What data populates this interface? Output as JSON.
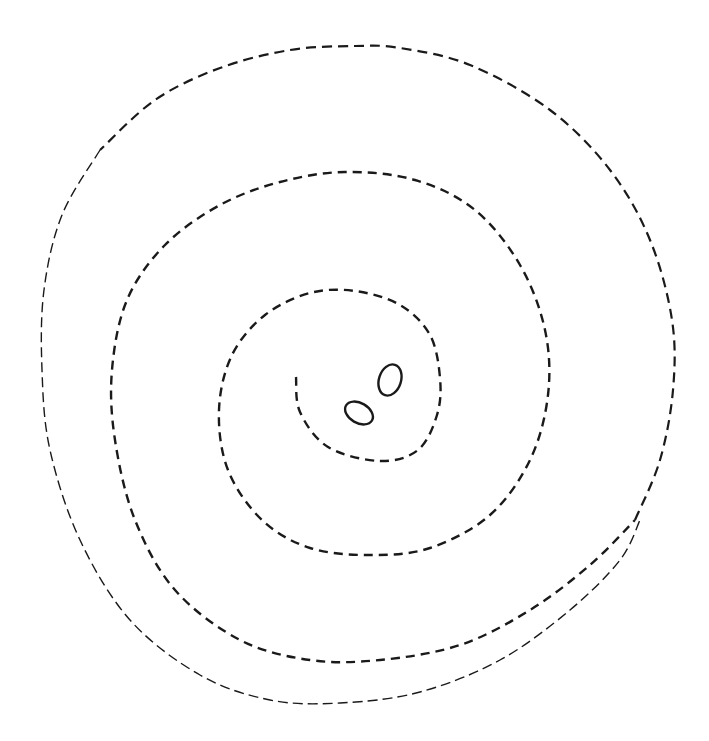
{
  "figure": {
    "background_color": "#ffffff",
    "stroke_color": "#1a1a1a",
    "elements": {
      "spiral": {
        "type": "dashed-spiral",
        "start_point": [
          296,
          377
        ],
        "turns": 3.5,
        "inner_segment": {
          "stroke_width": 2.4,
          "dash": "9 6",
          "points": [
            [
              296,
              377
            ],
            [
              300,
              412
            ],
            [
              328,
              447
            ],
            [
              380,
              461
            ],
            [
              418,
              450
            ],
            [
              437,
              415
            ],
            [
              440,
              378
            ],
            [
              430,
              335
            ],
            [
              400,
              305
            ],
            [
              355,
              291
            ],
            [
              310,
              293
            ],
            [
              265,
              315
            ],
            [
              232,
              355
            ],
            [
              219,
              410
            ],
            [
              228,
              470
            ],
            [
              262,
              520
            ],
            [
              310,
              548
            ],
            [
              370,
              555
            ],
            [
              430,
              548
            ],
            [
              490,
              515
            ],
            [
              530,
              460
            ],
            [
              548,
              395
            ],
            [
              545,
              330
            ],
            [
              520,
              265
            ],
            [
              475,
              210
            ],
            [
              415,
              180
            ],
            [
              345,
              172
            ],
            [
              280,
              182
            ],
            [
              220,
              205
            ],
            [
              165,
              245
            ],
            [
              127,
              300
            ],
            [
              112,
              370
            ],
            [
              115,
              440
            ],
            [
              135,
              520
            ],
            [
              175,
              590
            ],
            [
              240,
              640
            ],
            [
              310,
              660
            ],
            [
              380,
              660
            ],
            [
              460,
              645
            ],
            [
              530,
              610
            ],
            [
              590,
              565
            ],
            [
              635,
              520
            ]
          ]
        },
        "outer_segment": {
          "stroke_width": 2.2,
          "dash": "10 6",
          "points": [
            [
              635,
              520
            ],
            [
              660,
              460
            ],
            [
              673,
              390
            ],
            [
              672,
              320
            ],
            [
              650,
              240
            ],
            [
              610,
              170
            ],
            [
              550,
              110
            ],
            [
              470,
              65
            ],
            [
              400,
              48
            ],
            [
              355,
              46
            ],
            [
              290,
              50
            ],
            [
              220,
              68
            ],
            [
              155,
              100
            ],
            [
              100,
              150
            ]
          ]
        },
        "outermost_segment": {
          "stroke_width": 1.4,
          "dash": "10 5",
          "points": [
            [
              100,
              150
            ],
            [
              62,
              215
            ],
            [
              44,
              290
            ],
            [
              42,
              370
            ],
            [
              50,
              450
            ],
            [
              80,
              540
            ],
            [
              130,
              620
            ],
            [
              200,
              675
            ],
            [
              270,
              700
            ],
            [
              340,
              703
            ],
            [
              420,
              692
            ],
            [
              500,
              660
            ],
            [
              570,
              610
            ],
            [
              620,
              560
            ],
            [
              640,
              520
            ]
          ]
        }
      },
      "ovals": [
        {
          "name": "upper-oval",
          "cx": 390,
          "cy": 380,
          "rx": 11,
          "ry": 16,
          "rotate": 18,
          "stroke_width": 2.4
        },
        {
          "name": "lower-oval",
          "cx": 359,
          "cy": 413,
          "rx": 15,
          "ry": 10,
          "rotate": 30,
          "stroke_width": 2.4
        }
      ]
    }
  }
}
